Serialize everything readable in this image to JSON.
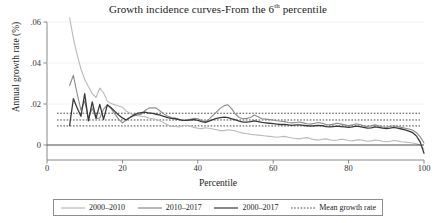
{
  "chart_data": {
    "type": "line",
    "title": "Growth incidence curves-From the 6th percentile",
    "title_main": "Growth incidence curves-From the 6",
    "title_sup": "th",
    "title_tail": " percentile",
    "xlabel": "Percentile",
    "ylabel": "Annual growth rate (%)",
    "xlim": [
      0,
      100
    ],
    "ylim": [
      -0.008,
      0.065
    ],
    "xticks": [
      0,
      20,
      40,
      60,
      80,
      100
    ],
    "xtick_labels": [
      "0",
      "20",
      "40",
      "60",
      "80",
      "100"
    ],
    "yticks": [
      0,
      0.02,
      0.04,
      0.06
    ],
    "ytick_labels": [
      "0",
      ".02",
      ".04",
      ".06"
    ],
    "grid": false,
    "legend_position": "bottom",
    "zero_line": 0,
    "colors": {
      "series_2000_2010": "#b9b9b9",
      "series_2010_2017": "#8a8a8a",
      "series_2000_2017": "#3a3a3a",
      "mean_line": "#4a4a4a",
      "axis": "#7a7a7a",
      "zero_line": "#4a4a4a",
      "legend_border": "#8d8d8d"
    },
    "x": [
      6,
      7,
      8,
      9,
      10,
      11,
      12,
      13,
      14,
      15,
      16,
      17,
      18,
      19,
      20,
      21,
      22,
      23,
      24,
      25,
      26,
      27,
      28,
      29,
      30,
      31,
      32,
      33,
      34,
      35,
      36,
      37,
      38,
      39,
      40,
      41,
      42,
      43,
      44,
      45,
      46,
      47,
      48,
      49,
      50,
      51,
      52,
      53,
      54,
      55,
      56,
      57,
      58,
      59,
      60,
      61,
      62,
      63,
      64,
      65,
      66,
      67,
      68,
      69,
      70,
      71,
      72,
      73,
      74,
      75,
      76,
      77,
      78,
      79,
      80,
      81,
      82,
      83,
      84,
      85,
      86,
      87,
      88,
      89,
      90,
      91,
      92,
      93,
      94,
      95,
      96,
      97,
      98,
      99,
      100
    ],
    "series": [
      {
        "name": "2000-2010",
        "style": "solid",
        "color": "#b9b9b9",
        "width": 1.1,
        "values": [
          0.062,
          0.052,
          0.044,
          0.0372,
          0.032,
          0.0284,
          0.025,
          0.0232,
          0.0278,
          0.0255,
          0.0214,
          0.0202,
          0.0196,
          0.019,
          0.0184,
          0.0166,
          0.0155,
          0.0148,
          0.0144,
          0.014,
          0.0138,
          0.0132,
          0.0128,
          0.0124,
          0.0118,
          0.0108,
          0.0098,
          0.0092,
          0.009,
          0.0088,
          0.0094,
          0.0096,
          0.0092,
          0.0086,
          0.0082,
          0.008,
          0.0084,
          0.0082,
          0.0078,
          0.0074,
          0.007,
          0.007,
          0.0074,
          0.0072,
          0.0068,
          0.0062,
          0.0058,
          0.0056,
          0.0052,
          0.005,
          0.0048,
          0.0046,
          0.0044,
          0.0042,
          0.004,
          0.0038,
          0.004,
          0.0042,
          0.0038,
          0.0034,
          0.0032,
          0.003,
          0.0034,
          0.0036,
          0.003,
          0.0026,
          0.0024,
          0.0028,
          0.003,
          0.0026,
          0.0022,
          0.0024,
          0.0028,
          0.0026,
          0.0022,
          0.002,
          0.0024,
          0.0026,
          0.0022,
          0.0018,
          0.002,
          0.0024,
          0.0022,
          0.0018,
          0.0016,
          0.0018,
          0.0022,
          0.002,
          0.0016,
          0.0014,
          0.0012,
          0.001,
          0.0006,
          0.0,
          -0.002
        ]
      },
      {
        "name": "2010-2017",
        "style": "solid",
        "color": "#8a8a8a",
        "width": 1.1,
        "values": [
          0.029,
          0.034,
          0.025,
          0.017,
          0.0215,
          0.0128,
          0.018,
          0.013,
          0.0132,
          0.0175,
          0.0196,
          0.0178,
          0.0152,
          0.0126,
          0.0108,
          0.0122,
          0.0134,
          0.0142,
          0.0146,
          0.015,
          0.0168,
          0.018,
          0.0182,
          0.018,
          0.0166,
          0.0152,
          0.014,
          0.0134,
          0.0132,
          0.0126,
          0.012,
          0.0122,
          0.0126,
          0.013,
          0.0128,
          0.012,
          0.0114,
          0.0126,
          0.0144,
          0.0162,
          0.018,
          0.0192,
          0.0196,
          0.0176,
          0.015,
          0.0134,
          0.0128,
          0.013,
          0.0134,
          0.0146,
          0.0138,
          0.0128,
          0.0126,
          0.0124,
          0.0122,
          0.0118,
          0.0116,
          0.0114,
          0.011,
          0.0108,
          0.011,
          0.0112,
          0.0108,
          0.0104,
          0.0102,
          0.0106,
          0.011,
          0.0106,
          0.01,
          0.0098,
          0.0102,
          0.0106,
          0.0102,
          0.0098,
          0.0094,
          0.0098,
          0.0104,
          0.01,
          0.0094,
          0.009,
          0.0094,
          0.0098,
          0.0094,
          0.0088,
          0.0086,
          0.009,
          0.0094,
          0.009,
          0.0086,
          0.0082,
          0.0078,
          0.0072,
          0.006,
          0.004,
          0.001
        ]
      },
      {
        "name": "2000-2017",
        "style": "solid",
        "color": "#3a3a3a",
        "width": 1.3,
        "values": [
          0.0095,
          0.0226,
          0.018,
          0.014,
          0.025,
          0.0118,
          0.021,
          0.013,
          0.0198,
          0.0125,
          0.0196,
          0.0182,
          0.0164,
          0.0146,
          0.0132,
          0.0122,
          0.0134,
          0.0146,
          0.0154,
          0.0158,
          0.016,
          0.0156,
          0.0154,
          0.015,
          0.0146,
          0.014,
          0.0134,
          0.013,
          0.0128,
          0.0124,
          0.012,
          0.012,
          0.0122,
          0.0124,
          0.012,
          0.0114,
          0.011,
          0.0116,
          0.0124,
          0.013,
          0.0134,
          0.0136,
          0.0134,
          0.0128,
          0.0122,
          0.0116,
          0.0112,
          0.0112,
          0.0114,
          0.0118,
          0.0114,
          0.011,
          0.0108,
          0.0106,
          0.0104,
          0.0102,
          0.01,
          0.01,
          0.0098,
          0.0096,
          0.0098,
          0.0098,
          0.0096,
          0.0094,
          0.0092,
          0.0094,
          0.0096,
          0.0094,
          0.009,
          0.0088,
          0.009,
          0.0092,
          0.009,
          0.0088,
          0.0086,
          0.0088,
          0.0092,
          0.009,
          0.0086,
          0.0082,
          0.0084,
          0.0088,
          0.0086,
          0.0082,
          0.008,
          0.0082,
          0.0086,
          0.0082,
          0.0078,
          0.0074,
          0.0068,
          0.006,
          0.0044,
          0.0014,
          -0.004
        ]
      }
    ],
    "mean_lines": [
      {
        "name": "Mean growth rate 2010-2017",
        "value": 0.0155,
        "style": "dotted",
        "color": "#4a4a4a"
      },
      {
        "name": "Mean growth rate 2000-2017",
        "value": 0.0122,
        "style": "dotted",
        "color": "#4a4a4a"
      },
      {
        "name": "Mean growth rate 2000-2010",
        "value": 0.0093,
        "style": "dotted",
        "color": "#4a4a4a"
      }
    ],
    "legend": [
      {
        "label": "2000–2010",
        "style": "solid",
        "color": "#b9b9b9"
      },
      {
        "label": "2010–2017",
        "style": "solid",
        "color": "#8a8a8a"
      },
      {
        "label": "2000–2017",
        "style": "solid",
        "color": "#3a3a3a"
      },
      {
        "label": "Mean growth rate",
        "style": "dotted",
        "color": "#4a4a4a"
      }
    ]
  }
}
